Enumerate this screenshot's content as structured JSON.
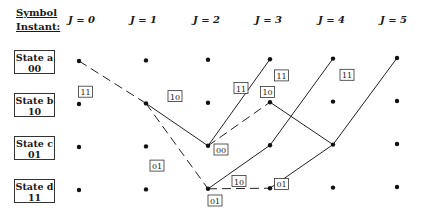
{
  "header": {
    "symbol": "Symbol",
    "instant": "Instant:"
  },
  "instants": [
    "J = 0",
    "J = 1",
    "J = 2",
    "J = 3",
    "J = 4",
    "J = 5"
  ],
  "states": [
    {
      "id": "a",
      "name": "State a",
      "code": "00"
    },
    {
      "id": "b",
      "name": "State b",
      "code": "10"
    },
    {
      "id": "c",
      "name": "State c",
      "code": "01"
    },
    {
      "id": "d",
      "name": "State d",
      "code": "11"
    }
  ],
  "branches": [
    {
      "from": [
        "a",
        0
      ],
      "to": [
        "b",
        1
      ],
      "label": "11",
      "style": "dashed"
    },
    {
      "from": [
        "b",
        1
      ],
      "to": [
        "c",
        2
      ],
      "label": "10",
      "style": "solid"
    },
    {
      "from": [
        "b",
        1
      ],
      "to": [
        "d",
        2
      ],
      "label": "01",
      "style": "dashed"
    },
    {
      "from": [
        "c",
        2
      ],
      "to": [
        "a",
        3
      ],
      "label": "11",
      "style": "solid"
    },
    {
      "from": [
        "c",
        2
      ],
      "to": [
        "b",
        3
      ],
      "label": "00",
      "style": "dashed"
    },
    {
      "from": [
        "d",
        2
      ],
      "to": [
        "c",
        3
      ],
      "label": "01",
      "style": "solid"
    },
    {
      "from": [
        "d",
        2
      ],
      "to": [
        "d",
        3
      ],
      "label": "10",
      "style": "dashed"
    },
    {
      "from": [
        "b",
        3
      ],
      "to": [
        "c",
        4
      ],
      "label": "10",
      "style": "solid"
    },
    {
      "from": [
        "c",
        3
      ],
      "to": [
        "a",
        4
      ],
      "label": "11",
      "style": "solid"
    },
    {
      "from": [
        "d",
        3
      ],
      "to": [
        "c",
        4
      ],
      "label": "01",
      "style": "solid"
    },
    {
      "from": [
        "c",
        4
      ],
      "to": [
        "a",
        5
      ],
      "label": "11",
      "style": "solid"
    }
  ]
}
